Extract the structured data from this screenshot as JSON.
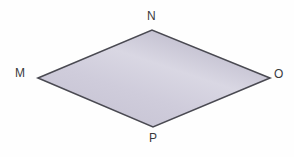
{
  "figure": {
    "name": "rhombus-mnop",
    "shape_type": "rhombus",
    "background_color": "#fefefe",
    "fill": {
      "gradient_type": "linear",
      "angle_deg": 115,
      "stops": [
        {
          "offset": "0%",
          "color": "#c5c2d2"
        },
        {
          "offset": "38%",
          "color": "#cfccdb"
        },
        {
          "offset": "62%",
          "color": "#d9d7e3"
        },
        {
          "offset": "100%",
          "color": "#b7b4c6"
        }
      ]
    },
    "stroke": {
      "color": "#4a4a52",
      "width": 1.6
    },
    "vertices": [
      {
        "id": "M",
        "label": "M",
        "x": 38,
        "y": 78,
        "label_x": 15,
        "label_y": 67
      },
      {
        "id": "N",
        "label": "N",
        "x": 152,
        "y": 30,
        "label_x": 147,
        "label_y": 10
      },
      {
        "id": "O",
        "label": "O",
        "x": 270,
        "y": 78,
        "label_x": 274,
        "label_y": 68
      },
      {
        "id": "P",
        "label": "P",
        "x": 153,
        "y": 127,
        "label_x": 149,
        "label_y": 132
      }
    ],
    "polygon_points": "38,78 152,30 270,78 153,127",
    "label_color": "#3a3a3c",
    "label_font_size_px": 12
  }
}
